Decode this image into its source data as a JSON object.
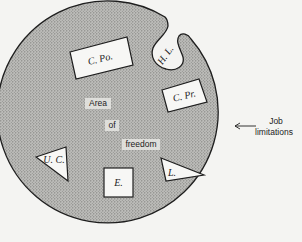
{
  "diagram": {
    "type": "area-of-freedom-diagram",
    "central_region": {
      "label_lines": [
        "Area",
        "of",
        "freedom"
      ]
    },
    "boundary": {
      "label_lines": [
        "Job",
        "limitations"
      ],
      "arrow": "left-arrow"
    },
    "shapes": [
      {
        "id": "c-po",
        "shape": "rectangle",
        "label": "C. Po."
      },
      {
        "id": "h-l",
        "shape": "teardrop-notch",
        "label": "H. L."
      },
      {
        "id": "c-pr",
        "shape": "rectangle",
        "label": "C. Pr."
      },
      {
        "id": "u-c",
        "shape": "triangle",
        "label": "U. C."
      },
      {
        "id": "e",
        "shape": "square",
        "label": "E."
      },
      {
        "id": "l",
        "shape": "triangle",
        "label": "L."
      }
    ],
    "colors": {
      "background": "#f4f4f2",
      "stipple_fill": "#b9b9b6",
      "stipple_dot": "#6f6f6c",
      "outline": "#1e1e1e",
      "shape_fill": "#f7f7f5"
    }
  }
}
